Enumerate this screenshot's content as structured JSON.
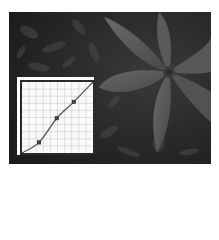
{
  "image": {
    "description": "Grayscale photograph of a star-shaped flower with broad petals against dark foliage, with a tone curves adjustment graph overlaid in the lower-left",
    "background_color": "#ffffff",
    "photo_base_color": "#262626"
  },
  "curves_panel": {
    "grid_divisions": 10,
    "grid_color": "#c8c8c8",
    "frame_color": "#2a2a2a",
    "curve_color": "#555555",
    "control_points": [
      {
        "input": 0,
        "output": 0
      },
      {
        "input": 24,
        "output": 15
      },
      {
        "input": 49,
        "output": 49
      },
      {
        "input": 73,
        "output": 72
      },
      {
        "input": 100,
        "output": 100
      }
    ]
  }
}
